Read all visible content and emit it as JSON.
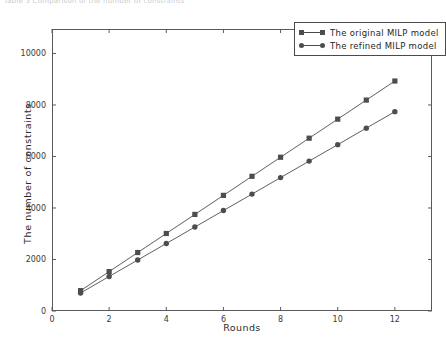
{
  "top_caption": "Table 5 Comparison of the number of constraints",
  "chart_data": {
    "type": "line",
    "title": "",
    "xlabel": "Rounds",
    "ylabel": "The number of constraints",
    "xlim": [
      0,
      13.3
    ],
    "ylim": [
      0,
      10950
    ],
    "xticks": [
      0,
      2,
      4,
      6,
      8,
      10,
      12
    ],
    "yticks": [
      0,
      2000,
      4000,
      6000,
      8000,
      10000
    ],
    "xticklabels": [
      "0",
      "2",
      "4",
      "6",
      "8",
      "10",
      "12"
    ],
    "yticklabels": [
      "0",
      "2000",
      "4000",
      "6000",
      "8000",
      "10000"
    ],
    "grid": false,
    "legend_position": "upper right",
    "x": [
      1,
      2,
      3,
      4,
      5,
      6,
      7,
      8,
      9,
      10,
      11,
      12
    ],
    "series": [
      {
        "name": "The original MILP model",
        "marker": "square",
        "color": "#4d4d4d",
        "values": [
          790,
          1530,
          2270,
          3010,
          3750,
          4490,
          5230,
          5970,
          6710,
          7450,
          8190,
          8930
        ]
      },
      {
        "name": "The refined MILP model",
        "marker": "circle",
        "color": "#4d4d4d",
        "values": [
          700,
          1340,
          1980,
          2620,
          3260,
          3900,
          4540,
          5180,
          5820,
          6460,
          7100,
          7740
        ]
      }
    ]
  },
  "legend": {
    "entries": [
      {
        "label": "The original MILP model"
      },
      {
        "label": "The refined MILP model"
      }
    ]
  }
}
